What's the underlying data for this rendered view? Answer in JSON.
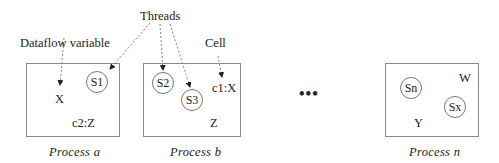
{
  "annotations": {
    "threads": "Threads",
    "dataflow_variable": "Dataflow variable",
    "cell": "Cell"
  },
  "processes": [
    {
      "caption": "Process a",
      "threads": [
        "S1"
      ],
      "items": [
        "X",
        "c2:Z"
      ]
    },
    {
      "caption": "Process b",
      "threads": [
        "S2",
        "S3"
      ],
      "items": [
        "c1:X",
        "Z"
      ]
    },
    {
      "caption": "Process n",
      "threads": [
        "Sn",
        "Sx"
      ],
      "items": [
        "W",
        "Y"
      ]
    }
  ],
  "ellipsis": "•••",
  "colors": {
    "box_border": "#888888",
    "arrow": "#666666",
    "text": "#222222"
  }
}
